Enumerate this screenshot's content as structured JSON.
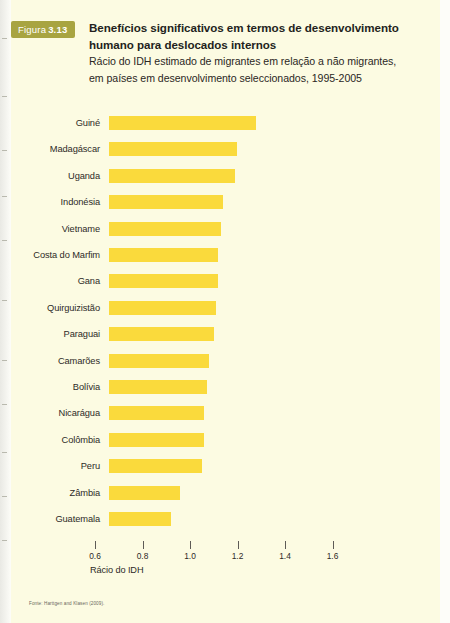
{
  "figure": {
    "badge_word": "Figura",
    "badge_number": "3.13",
    "badge_color": "#a8a441",
    "panel_color": "#fcfbe2",
    "title_line1": "Benefícios significativos em termos de desenvolvimento",
    "title_line2": "humano para deslocados internos",
    "subtitle_line1": "Rácio do IDH estimado de migrantes em relação a não migrantes,",
    "subtitle_line2": "em países em desenvolvimento seleccionados, 1995-2005",
    "source": "Fonte: Harttgen and Klasen (2009)."
  },
  "chart_data": {
    "type": "bar",
    "orientation": "horizontal",
    "title": "Benefícios significativos em termos de desenvolvimento humano para deslocados internos",
    "subtitle": "Rácio do IDH estimado de migrantes em relação a não migrantes, em países em desenvolvimento seleccionados, 1995-2005",
    "xlabel": "Rácio do IDH",
    "ylabel": "",
    "xlim": [
      0.659,
      1.75
    ],
    "bar_base": 0.659,
    "xticks": [
      0.6,
      0.8,
      1.0,
      1.2,
      1.4,
      1.6
    ],
    "xticklabels": [
      "0.6",
      "0.8",
      "1.0",
      "1.2",
      "1.4",
      "1.6"
    ],
    "grid": false,
    "legend": false,
    "bar_color": "#fada3c",
    "categories": [
      "Guiné",
      "Madagáscar",
      "Uganda",
      "Indonésia",
      "Vietname",
      "Costa do Marfim",
      "Gana",
      "Quirguizistão",
      "Paraguai",
      "Camarões",
      "Bolívia",
      "Nicarágua",
      "Colômbia",
      "Peru",
      "Zâmbia",
      "Guatemala"
    ],
    "values": [
      1.28,
      1.2,
      1.19,
      1.14,
      1.13,
      1.12,
      1.12,
      1.11,
      1.1,
      1.08,
      1.07,
      1.06,
      1.06,
      1.05,
      0.96,
      0.92
    ]
  }
}
